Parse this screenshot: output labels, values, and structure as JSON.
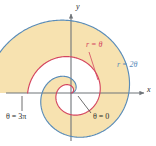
{
  "figure": {
    "name": "polar-spiral-region",
    "background": "#ffffff"
  },
  "axes": {
    "x_label": "x",
    "y_label": "y",
    "origin_x": 71,
    "origin_y": 93,
    "x_axis_from": 6,
    "x_axis_to": 146,
    "y_axis_from": 12,
    "y_axis_to": 141,
    "axis_color": "#6f7479"
  },
  "labels": {
    "inner_curve": "r = θ",
    "outer_curve": "r = 2θ",
    "angle_start": "θ = 0",
    "angle_end": "θ = 3π"
  },
  "colors": {
    "inner_curve": "#d4455f",
    "outer_curve": "#5a8cb8",
    "region_fill": "#f7e2b0",
    "axis": "#6f7479",
    "text": "#2b2b2b",
    "leader_red": "#d4455f",
    "leader_dark": "#4a4a4a"
  },
  "chart_data": {
    "type": "line",
    "title": "",
    "subtitle": "",
    "xlabel": "x",
    "ylabel": "y",
    "coordinate_system": "polar",
    "grid": false,
    "legend": "inline-annotations",
    "theta_range": [
      0,
      9.42477796
    ],
    "theta_range_label": [
      "θ = 0",
      "θ = 3π"
    ],
    "scale_px_per_unit": 4.6,
    "shaded_region": {
      "description": "Region between r = θ and r = 2θ for 0 ≤ θ ≤ 3π",
      "fill": "#f7e2b0",
      "inner_boundary": "r = θ",
      "outer_boundary": "r = 2θ"
    },
    "series": [
      {
        "name": "r = θ",
        "equation": "r = theta",
        "color": "#d4455f",
        "coefficient": 1,
        "theta_start": 0,
        "theta_end": 9.42477796,
        "r_start": 0,
        "r_end": 9.42477796
      },
      {
        "name": "r = 2θ",
        "equation": "r = 2*theta",
        "color": "#5a8cb8",
        "coefficient": 2,
        "theta_start": 0,
        "theta_end": 9.42477796,
        "r_start": 0,
        "r_end": 18.84955592
      }
    ],
    "annotations": [
      {
        "text": "r = θ",
        "color": "#d4455f",
        "target": "inner spiral"
      },
      {
        "text": "r = 2θ",
        "color": "#5a8cb8",
        "target": "outer spiral"
      },
      {
        "text": "θ = 0",
        "color": "#2b2b2b",
        "target": "positive x-axis at start of spiral"
      },
      {
        "text": "θ = 3π",
        "color": "#2b2b2b",
        "target": "negative x-axis at end of spiral"
      }
    ],
    "axis_ticks": {
      "x": [],
      "y": []
    }
  }
}
